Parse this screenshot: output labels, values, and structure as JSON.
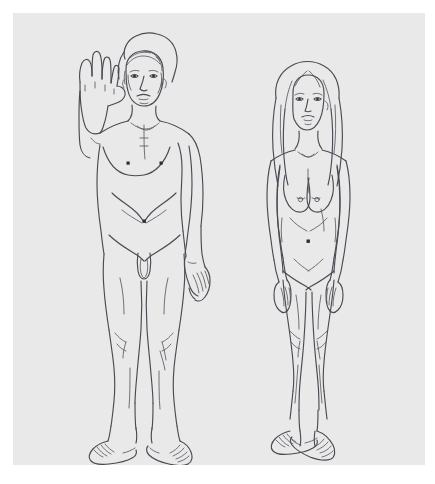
{
  "page": {
    "type": "illustration"
  },
  "canvas": {
    "width_px": 435,
    "height_px": 484,
    "margin_px": 13,
    "panel_width_px": 412,
    "panel_height_px": 452
  },
  "colors": {
    "page_background": "#ffffff",
    "panel_background": "#e9e9e9",
    "ink": "#4a4a52",
    "ink_light": "#5a5a62",
    "dot": "#2d2d33"
  },
  "figures": [
    {
      "id": "male-figure",
      "label": "Man",
      "pose": "standing, right arm raised with open palm in greeting, left arm at side",
      "position": "left",
      "hair": "short wavy hair",
      "landmarks": [
        "head",
        "raised-hand",
        "chest",
        "nipples",
        "navel",
        "genitals",
        "knees",
        "feet"
      ]
    },
    {
      "id": "female-figure",
      "label": "Woman",
      "pose": "standing, both arms at sides, weight slightly on one leg",
      "position": "right",
      "hair": "long straight hair past the shoulders",
      "landmarks": [
        "head",
        "breasts",
        "navel",
        "hips",
        "knees",
        "feet"
      ]
    }
  ],
  "marks": {
    "male_nipple_left": "dot",
    "male_nipple_right": "dot",
    "male_navel": "dot",
    "female_navel": "dot"
  }
}
